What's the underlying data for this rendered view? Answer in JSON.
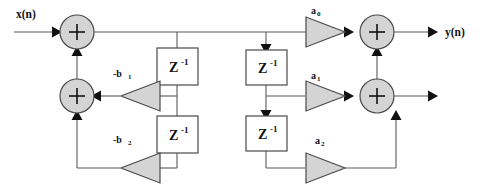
{
  "diagram": {
    "background_color": "#ffffff",
    "wire_color": "#5a5a5a",
    "node_fill": "#d4d4d4",
    "node_stroke": "#4a4a4a",
    "box_fill": "#ffffff",
    "arrow_color": "#111111",
    "io": {
      "input_label": "x(n)",
      "output_label": "y(n)"
    },
    "summers": [
      {
        "id": "sum-top-left",
        "symbol": "+",
        "cx": 77,
        "cy": 32,
        "r": 17
      },
      {
        "id": "sum-bottom-left",
        "symbol": "+",
        "cx": 77,
        "cy": 96,
        "r": 17
      },
      {
        "id": "sum-top-right",
        "symbol": "+",
        "cx": 377,
        "cy": 32,
        "r": 17
      },
      {
        "id": "sum-bottom-right",
        "symbol": "+",
        "cx": 377,
        "cy": 96,
        "r": 17
      }
    ],
    "delays": [
      {
        "id": "delay-feedback-1",
        "label": "Z",
        "exponent": "-1",
        "x": 157,
        "y": 48,
        "w": 41,
        "h": 37
      },
      {
        "id": "delay-feedback-2",
        "label": "Z",
        "exponent": "-1",
        "x": 157,
        "y": 116,
        "w": 41,
        "h": 37
      },
      {
        "id": "delay-feedforward-1",
        "label": "Z",
        "exponent": "-1",
        "x": 246,
        "y": 50,
        "w": 41,
        "h": 35
      },
      {
        "id": "delay-feedforward-2",
        "label": "Z",
        "exponent": "-1",
        "x": 246,
        "y": 116,
        "w": 41,
        "h": 35
      }
    ],
    "amplifiers": [
      {
        "id": "gain-b1",
        "label": "-b",
        "subscript": "1",
        "direction": "left",
        "label_x": 124,
        "label_y": 77
      },
      {
        "id": "gain-b2",
        "label": "-b",
        "subscript": "2",
        "direction": "left",
        "label_x": 124,
        "label_y": 143
      },
      {
        "id": "gain-a0",
        "label": "a",
        "subscript": "0",
        "direction": "right",
        "label_x": 316,
        "label_y": 14
      },
      {
        "id": "gain-a1",
        "label": "a",
        "subscript": "1",
        "direction": "right",
        "label_x": 316,
        "label_y": 79
      },
      {
        "id": "gain-a2",
        "label": "a",
        "subscript": "2",
        "direction": "right",
        "label_x": 320,
        "label_y": 144
      }
    ]
  }
}
